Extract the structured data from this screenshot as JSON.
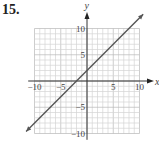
{
  "problem_number": "15.",
  "chart_data": {
    "type": "line",
    "title": "",
    "xlabel": "x",
    "ylabel": "y",
    "xlim": [
      -10,
      10
    ],
    "ylim": [
      -10,
      10
    ],
    "grid": true,
    "grid_step": 1,
    "x_ticks": [
      {
        "value": -10,
        "label": "−10"
      },
      {
        "value": -5,
        "label": "−5"
      },
      {
        "value": 5,
        "label": "5"
      },
      {
        "value": 10,
        "label": "10"
      }
    ],
    "y_ticks": [
      {
        "value": 10,
        "label": "10"
      },
      {
        "value": 5,
        "label": "5"
      },
      {
        "value": -5,
        "label": "−5"
      },
      {
        "value": -10,
        "label": "−10"
      }
    ],
    "series": [
      {
        "name": "line",
        "equation": "y = x + 2",
        "slope": 1,
        "intercept": 2,
        "x": [
          -11.6,
          10.7
        ],
        "y": [
          -9.6,
          12.7
        ],
        "arrows_both_ends": true,
        "color": "#555555"
      }
    ]
  }
}
